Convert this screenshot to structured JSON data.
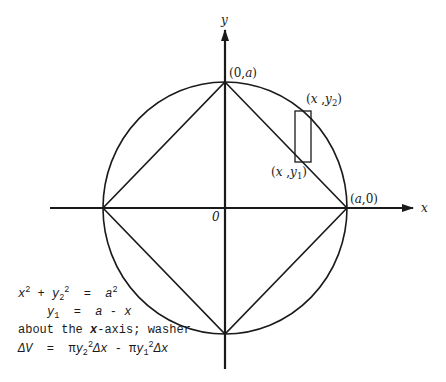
{
  "figure": {
    "type": "geometry-diagram",
    "axes": {
      "x_label": "x",
      "y_label": "y",
      "origin_label": "0"
    },
    "points": {
      "top": "(0,a)",
      "right": "(a,0)",
      "upper_element": "(x,y2)",
      "lower_element": "(x,y1)"
    },
    "point_labels": {
      "top": {
        "open": "(0,",
        "var": "a",
        "close": ")"
      },
      "right": {
        "open": "(",
        "var": "a",
        "close": ",0)"
      },
      "upper": {
        "open": "(",
        "x": "x",
        "comma": " ,",
        "y": "y",
        "sub": "2",
        "close": ")"
      },
      "lower": {
        "open": "(",
        "x": "x",
        "comma": " ,",
        "y": "y",
        "sub": "1",
        "close": ")"
      }
    },
    "equations": {
      "line1": {
        "x": "x",
        "exp1": "2",
        "plus": " + ",
        "y": "y",
        "sub": "2",
        "exp2": "2",
        "eq": "  =  ",
        "a": "a",
        "exp3": "2"
      },
      "line2": {
        "y": "y",
        "sub": "1",
        "eq": "  =  ",
        "rhs_a": "a",
        "minus": " - ",
        "rhs_x": "x"
      },
      "line3": {
        "pre": "about the ",
        "x": "x",
        "post": "-axis; washer"
      },
      "line4": {
        "dV": "ΔV",
        "eq": "  =  ",
        "pi1": "π",
        "y2": "y",
        "sub2": "2",
        "exp2": "2",
        "dx1": "Δx",
        "minus": " - ",
        "pi2": "π",
        "y1": "y",
        "sub1": "1",
        "exp1": "2",
        "dx2": "Δx"
      }
    }
  }
}
